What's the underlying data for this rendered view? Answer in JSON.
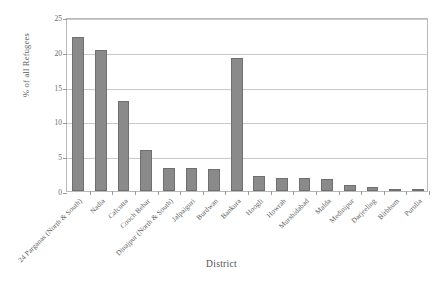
{
  "chart_data": {
    "type": "bar",
    "title": "",
    "xlabel": "District",
    "ylabel": "% of all Refugees",
    "ylim": [
      0,
      25
    ],
    "yticks": [
      0,
      5,
      10,
      15,
      20,
      25
    ],
    "grid": true,
    "legend": "none",
    "bar_color": "#8a8a8a",
    "bar_border_color": "#6f6f6f",
    "categories": [
      "24 Parganas (North & South)",
      "Nadia",
      "Calcutta",
      "Cooch Behar",
      "Dinajpur (North & South)",
      "Jalpaiguri",
      "Burdwan",
      "Bankura",
      "Hoogli",
      "Howrah",
      "Murshidabad",
      "Malda",
      "Medinipur",
      "Darjeeling",
      "Birbhum",
      "Purulia"
    ],
    "values": [
      22.2,
      20.2,
      12.9,
      5.9,
      3.3,
      3.3,
      3.2,
      19.1,
      2.1,
      1.9,
      1.9,
      1.7,
      0.8,
      0.6,
      0.2,
      0.2
    ]
  }
}
